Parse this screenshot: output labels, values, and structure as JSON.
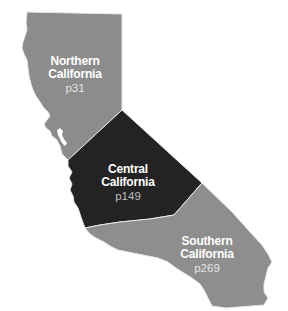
{
  "map": {
    "title": "California regions",
    "colors": {
      "northern": "#8c8c8c",
      "central": "#232323",
      "southern": "#8e8e8e",
      "border": "#e8e8e8",
      "background": "#ffffff"
    },
    "regions": [
      {
        "id": "northern",
        "name_line1": "Northern",
        "name_line2": "California",
        "page": "p31"
      },
      {
        "id": "central",
        "name_line1": "Central",
        "name_line2": "California",
        "page": "p149"
      },
      {
        "id": "southern",
        "name_line1": "Southern",
        "name_line2": "California",
        "page": "p269"
      }
    ]
  }
}
